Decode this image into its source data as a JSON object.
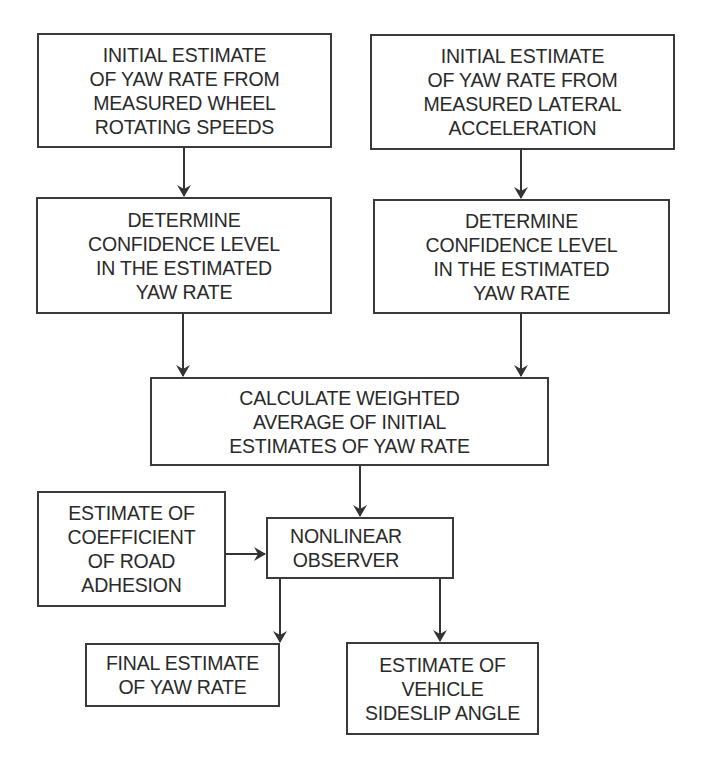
{
  "diagram": {
    "type": "flowchart",
    "nodes": [
      {
        "id": "wheel_estimate",
        "label": "INITIAL ESTIMATE\nOF YAW RATE FROM\nMEASURED WHEEL\nROTATING SPEEDS"
      },
      {
        "id": "lateral_estimate",
        "label": "INITIAL ESTIMATE\nOF YAW RATE FROM\nMEASURED LATERAL\nACCELERATION"
      },
      {
        "id": "confidence_left",
        "label": "DETERMINE\nCONFIDENCE LEVEL\nIN THE ESTIMATED\nYAW RATE"
      },
      {
        "id": "confidence_right",
        "label": "DETERMINE\nCONFIDENCE LEVEL\nIN THE ESTIMATED\nYAW RATE"
      },
      {
        "id": "weighted_average",
        "label": "CALCULATE WEIGHTED\nAVERAGE OF INITIAL\nESTIMATES OF YAW RATE"
      },
      {
        "id": "road_adhesion",
        "label": "ESTIMATE OF\nCOEFFICIENT\nOF ROAD\nADHESION"
      },
      {
        "id": "nonlinear_observer",
        "label": "NONLINEAR\nOBSERVER"
      },
      {
        "id": "final_yaw",
        "label": "FINAL ESTIMATE\nOF YAW RATE"
      },
      {
        "id": "sideslip",
        "label": "ESTIMATE OF\nVEHICLE\nSIDESLIP ANGLE"
      }
    ],
    "edges": [
      {
        "from": "wheel_estimate",
        "to": "confidence_left"
      },
      {
        "from": "lateral_estimate",
        "to": "confidence_right"
      },
      {
        "from": "confidence_left",
        "to": "weighted_average"
      },
      {
        "from": "confidence_right",
        "to": "weighted_average"
      },
      {
        "from": "weighted_average",
        "to": "nonlinear_observer"
      },
      {
        "from": "road_adhesion",
        "to": "nonlinear_observer"
      },
      {
        "from": "nonlinear_observer",
        "to": "final_yaw"
      },
      {
        "from": "nonlinear_observer",
        "to": "sideslip"
      }
    ],
    "colors": {
      "stroke": "#3a3a3a",
      "text": "#2a2a2a",
      "background": "#ffffff"
    }
  }
}
